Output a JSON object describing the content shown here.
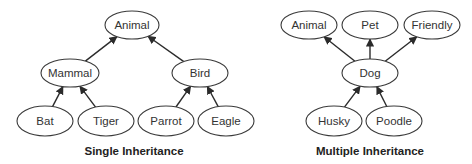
{
  "diagrams": [
    {
      "caption": "Single Inheritance",
      "caption_pos": [
        134,
        155
      ],
      "nodes": [
        {
          "id": "animal",
          "label": "Animal",
          "cx": 132,
          "cy": 25,
          "rx": 27,
          "ry": 14
        },
        {
          "id": "mammal",
          "label": "Mammal",
          "cx": 70,
          "cy": 73,
          "rx": 29,
          "ry": 14
        },
        {
          "id": "bird",
          "label": "Bird",
          "cx": 200,
          "cy": 73,
          "rx": 28,
          "ry": 14
        },
        {
          "id": "bat",
          "label": "Bat",
          "cx": 45,
          "cy": 121,
          "rx": 28,
          "ry": 15
        },
        {
          "id": "tiger",
          "label": "Tiger",
          "cx": 106,
          "cy": 121,
          "rx": 28,
          "ry": 15
        },
        {
          "id": "parrot",
          "label": "Parrot",
          "cx": 166,
          "cy": 121,
          "rx": 28,
          "ry": 15
        },
        {
          "id": "eagle",
          "label": "Eagle",
          "cx": 226,
          "cy": 121,
          "rx": 28,
          "ry": 15
        }
      ],
      "edges": [
        {
          "from": "mammal",
          "to": "animal"
        },
        {
          "from": "bird",
          "to": "animal"
        },
        {
          "from": "bat",
          "to": "mammal"
        },
        {
          "from": "tiger",
          "to": "mammal"
        },
        {
          "from": "parrot",
          "to": "bird"
        },
        {
          "from": "eagle",
          "to": "bird"
        }
      ]
    },
    {
      "caption": "Multiple Inheritance",
      "caption_pos": [
        370,
        155
      ],
      "nodes": [
        {
          "id": "animal2",
          "label": "Animal",
          "cx": 309,
          "cy": 25,
          "rx": 28,
          "ry": 14
        },
        {
          "id": "pet",
          "label": "Pet",
          "cx": 370,
          "cy": 25,
          "rx": 28,
          "ry": 14
        },
        {
          "id": "friendly",
          "label": "Friendly",
          "cx": 432,
          "cy": 25,
          "rx": 28,
          "ry": 14
        },
        {
          "id": "dog",
          "label": "Dog",
          "cx": 370,
          "cy": 73,
          "rx": 28,
          "ry": 14
        },
        {
          "id": "husky",
          "label": "Husky",
          "cx": 334,
          "cy": 121,
          "rx": 28,
          "ry": 15
        },
        {
          "id": "poodle",
          "label": "Poodle",
          "cx": 394,
          "cy": 121,
          "rx": 28,
          "ry": 15
        }
      ],
      "edges": [
        {
          "from": "dog",
          "to": "animal2"
        },
        {
          "from": "dog",
          "to": "pet"
        },
        {
          "from": "dog",
          "to": "friendly"
        },
        {
          "from": "husky",
          "to": "dog"
        },
        {
          "from": "poodle",
          "to": "dog"
        }
      ]
    }
  ]
}
